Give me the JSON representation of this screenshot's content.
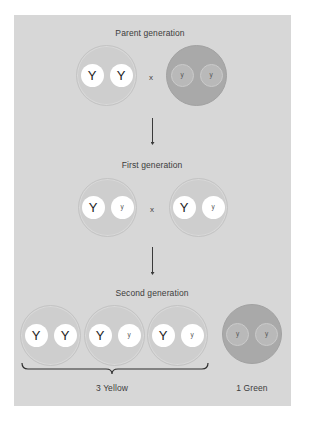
{
  "diagram": {
    "colors": {
      "background": "#ffffff",
      "panel": "#d7d7d7",
      "yellow_phenotype": "#cecece",
      "green_phenotype": "#a9a9a9",
      "dominant_allele": "#ffffff",
      "recessive_allele_in_green": "#b9b9b9",
      "text": "#3c3c3c"
    },
    "cross_symbol": "x",
    "parent_generation": {
      "label": "Parent generation",
      "organisms": [
        {
          "phenotype": "yellow",
          "alleles": [
            "Y",
            "Y"
          ]
        },
        {
          "phenotype": "green",
          "alleles": [
            "y",
            "y"
          ]
        }
      ]
    },
    "first_generation": {
      "label": "First generation",
      "organisms": [
        {
          "phenotype": "yellow",
          "alleles": [
            "Y",
            "y"
          ]
        },
        {
          "phenotype": "yellow",
          "alleles": [
            "Y",
            "y"
          ]
        }
      ]
    },
    "second_generation": {
      "label": "Second generation",
      "organisms": [
        {
          "phenotype": "yellow",
          "alleles": [
            "Y",
            "Y"
          ]
        },
        {
          "phenotype": "yellow",
          "alleles": [
            "Y",
            "y"
          ]
        },
        {
          "phenotype": "yellow",
          "alleles": [
            "Y",
            "y"
          ]
        },
        {
          "phenotype": "green",
          "alleles": [
            "y",
            "y"
          ]
        }
      ],
      "summary": {
        "yellow_label": "3 Yellow",
        "green_label": "1 Green"
      }
    }
  }
}
